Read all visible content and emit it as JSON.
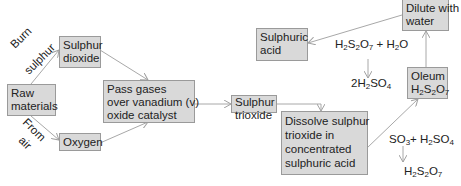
{
  "diagram": {
    "type": "flowchart",
    "nodes": {
      "raw": {
        "line1": "Raw",
        "line2": "materials"
      },
      "so2": {
        "line1": "Sulphur",
        "line2": "dioxide"
      },
      "oxygen": {
        "line1": "Oxygen"
      },
      "catalyst": {
        "line1": "Pass gases",
        "line2": "over vanadium (v)",
        "line3": "oxide catalyst"
      },
      "so3": {
        "line1": "Sulphur",
        "line2": "trioxide"
      },
      "dissolve": {
        "line1": "Dissolve sulphur",
        "line2": "trioxide in",
        "line3": "concentrated",
        "line4": "sulphuric acid"
      },
      "oleum": {
        "line1": "Oleum"
      },
      "dilute": {
        "line1": "Dilute with",
        "line2": "water"
      },
      "acid": {
        "line1": "Sulphuric",
        "line2": "acid"
      }
    },
    "edge_labels": {
      "burn1": "Burn",
      "burn2": "sulphur",
      "air1": "From",
      "air2": "air"
    },
    "equations": {
      "eq1": "SO3 + H2SO4 → H2S2O7",
      "eq2": "H2S2O7 + H2O → 2H2SO4"
    },
    "colors": {
      "box_fill": "#d9d9d9",
      "box_border": "#9a9a9a",
      "arrow": "#a0a0a0"
    }
  }
}
